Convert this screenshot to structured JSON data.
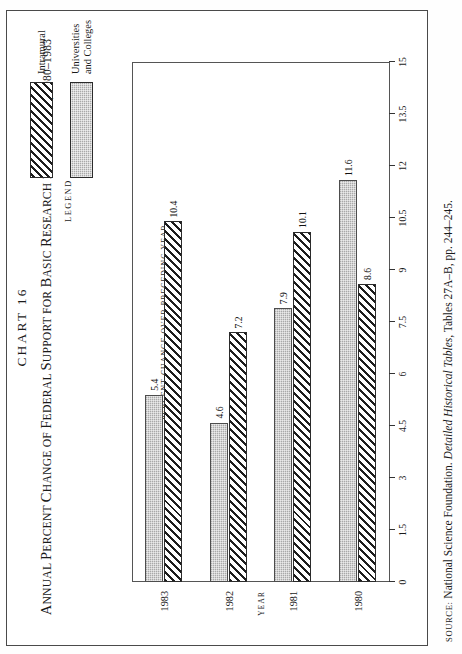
{
  "figure": {
    "chart_number": "CHART 16",
    "title_parts": {
      "a": "A",
      "b": "nnual ",
      "c": "P",
      "d": "ercent ",
      "e": "C",
      "f": "hange of ",
      "g": "F",
      "h": "ederal ",
      "i": "S",
      "j": "upport for ",
      "k": "B",
      "l": "asic ",
      "m": "R",
      "n": "esearch by ",
      "o": "R",
      "p": "eceiver, 1980–1983"
    },
    "title_plain": "ANNUAL PERCENT CHANGE OF FEDERAL SUPPORT FOR BASIC RESEARCH BY RECEIVER, 1980–1983"
  },
  "legend": {
    "heading": "LEGEND",
    "entries": [
      {
        "label": "Intramural",
        "pattern": "diagonal-hatch",
        "color": "#ffffff"
      },
      {
        "label": "Universities\nand Colleges",
        "label_line1": "Universities",
        "label_line2": "and Colleges",
        "pattern": "gray-dots",
        "color": "#a9a9a9"
      }
    ]
  },
  "source": {
    "label": "SOURCE:",
    "text_before": " National Science Foundation. ",
    "italic": "Detailed Historical Tables",
    "text_after": ", Tables 27A–B, pp. 244–245."
  },
  "chart_data": {
    "type": "bar",
    "orientation": "horizontal",
    "title": "Annual Percent Change of Federal Support for Basic Research by Receiver, 1980–1983",
    "categories": [
      "1980",
      "1981",
      "1982",
      "1983"
    ],
    "xlabel": "PERCENT CHANGE OVER PRECEDING YEAR",
    "ylabel": "YEAR",
    "xlim": [
      0,
      15
    ],
    "xticks": [
      "0",
      "1.5",
      "3",
      "4.5",
      "6",
      "7.5",
      "9",
      "10.5",
      "12",
      "13.5",
      "15"
    ],
    "xtick_values": [
      0,
      1.5,
      3,
      4.5,
      6,
      7.5,
      9,
      10.5,
      12,
      13.5,
      15
    ],
    "grid": false,
    "legend_position": "top-right-outside",
    "series": [
      {
        "name": "Intramural",
        "pattern": "diagonal-hatch",
        "values": [
          8.6,
          10.1,
          7.2,
          10.4
        ]
      },
      {
        "name": "Universities and Colleges",
        "pattern": "gray-dots",
        "values": [
          11.6,
          7.9,
          4.6,
          5.4
        ]
      }
    ],
    "data_labels": [
      {
        "category": "1980",
        "series": "Intramural",
        "value": "8.6"
      },
      {
        "category": "1980",
        "series": "Universities and Colleges",
        "value": "11.6"
      },
      {
        "category": "1981",
        "series": "Intramural",
        "value": "10.1"
      },
      {
        "category": "1981",
        "series": "Universities and Colleges",
        "value": "7.9"
      },
      {
        "category": "1982",
        "series": "Intramural",
        "value": "7.2"
      },
      {
        "category": "1982",
        "series": "Universities and Colleges",
        "value": "4.6"
      },
      {
        "category": "1983",
        "series": "Intramural",
        "value": "10.4"
      },
      {
        "category": "1983",
        "series": "Universities and Colleges",
        "value": "5.4"
      }
    ]
  }
}
